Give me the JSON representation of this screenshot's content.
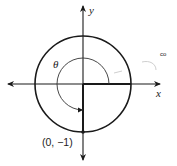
{
  "diagram": {
    "type": "unit-circle",
    "axes": {
      "x_label": "x",
      "y_label": "y"
    },
    "angle_label": "θ",
    "point_label": "(0, −1)",
    "point": [
      0,
      -1
    ],
    "colors": {
      "stroke": "#1a1a1a",
      "faint": "#c8c8c8",
      "background": "#ffffff"
    }
  }
}
